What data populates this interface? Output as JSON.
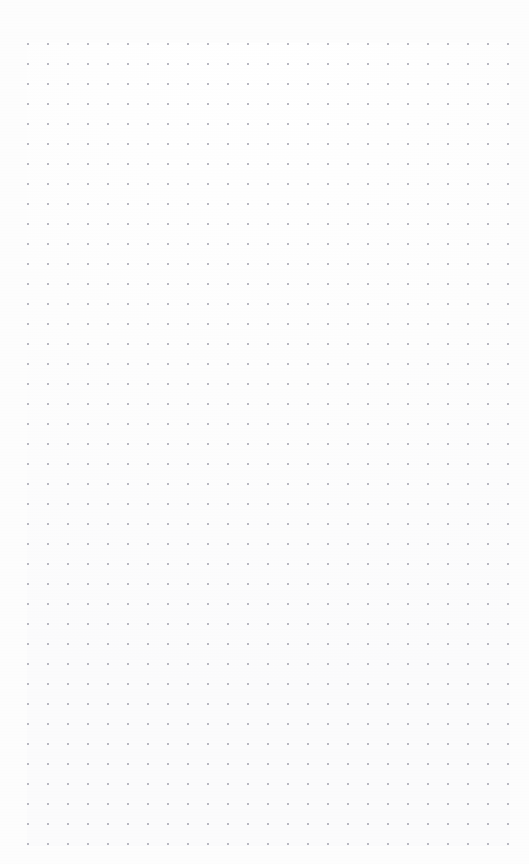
{
  "canvas": {
    "title": "Dot Grid Page",
    "width": 529,
    "height": 864,
    "background_color": "#fdfdfd",
    "surface_type": "dot-grid-paper",
    "content_text": ""
  },
  "grid": {
    "dot_color": "#b9b9c2",
    "dot_size_px": 1.5,
    "pitch_px": 20,
    "origin_x_px": 28,
    "origin_y_px": 44,
    "columns": 25,
    "rows": 41,
    "first_dot_x_px": 28,
    "first_dot_y_px": 44,
    "last_dot_x_px": 508,
    "last_dot_y_px": 844,
    "margin_top_px": 34,
    "margin_bottom_px": 10,
    "margin_left_px": 18,
    "margin_right_px": 11
  },
  "chart_data": {
    "type": "scatter",
    "title": "",
    "xlabel": "",
    "ylabel": "",
    "grid": true,
    "legend": "none",
    "xlim": [
      28,
      508
    ],
    "ylim": [
      44,
      844
    ],
    "x_tick_step": 20,
    "y_tick_step": 20,
    "point_color": "#b9b9c2",
    "point_size_px": 1.5,
    "columns": 25,
    "rows": 41,
    "total_points": 1025
  }
}
